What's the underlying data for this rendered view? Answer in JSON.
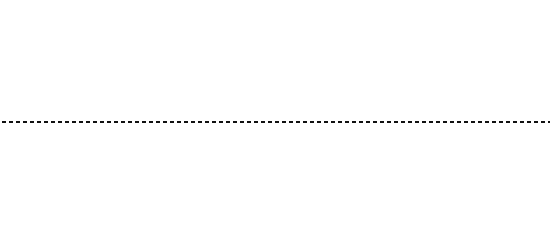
{
  "figure": {
    "background_color": "#ffffff",
    "digit_color": "#2b2b2b",
    "curve_color": "#3fc23f",
    "axis_color": "#111111",
    "annotation_color": "#202020",
    "panel_count": 2
  },
  "separator": {
    "name": "dashed-axis",
    "style": "dashed",
    "tick_count": 9,
    "tick_positions_px": [
      18,
      85,
      152,
      219,
      286,
      353,
      420,
      487,
      545
    ]
  },
  "panels": [
    {
      "id": "top",
      "vline_x_px": 73,
      "curve": {
        "color": "#3fc23f",
        "stroke_width": 1.9,
        "x_center_px": 118,
        "points": [
          [
            140,
            1
          ],
          [
            133,
            5
          ],
          [
            126,
            10
          ],
          [
            120,
            14
          ],
          [
            113,
            18
          ],
          [
            106,
            22
          ],
          [
            100,
            25
          ],
          [
            105,
            29
          ],
          [
            112,
            33
          ],
          [
            118,
            37
          ],
          [
            120,
            40
          ],
          [
            114,
            44
          ],
          [
            107,
            47
          ],
          [
            101,
            51
          ],
          [
            98,
            54
          ],
          [
            104,
            58
          ],
          [
            111,
            61
          ],
          [
            117,
            65
          ],
          [
            121,
            69
          ],
          [
            116,
            73
          ],
          [
            109,
            76
          ],
          [
            103,
            80
          ],
          [
            99,
            83
          ],
          [
            106,
            87
          ],
          [
            113,
            90
          ],
          [
            120,
            94
          ],
          [
            128,
            97
          ],
          [
            136,
            100
          ],
          [
            142,
            103
          ],
          [
            147,
            106
          ],
          [
            143,
            109
          ]
        ]
      },
      "rows": [
        "5 7 8 6 5 4 6 6 8 5 8 4 8 9 4 7 1 3 5 8 7 6 9 3 6 7 4 8 7 3 4 6 9 3 5 7 6 3 8 9 4 8 3 6 1 8 8 6 5 4 9 6 8 7 4 3 5 9 7 4 8 3 6 7 9 5 3 8 6 4 9 8 3 7 1 8 9 4 7 6 3 8 7 5 4 8 6 5 9 6 8 7 4",
        "6 5 4 7 8 6 3 9 8 2 9 8 4 4 7 6 8 8 2 3 7 8 5 4 6 9 5 4 8 3 7 2 6 4 8 9 3 5 7 6 4 8 2 9 5 7 6 3 8 4 7 9 5 2 6 8 3 4 7 5 9 6 2 8 4 7 3 5 9 6 8 2 4 7 8 3 6 5 9 4 7 2 8 6 3 5 9 7 4 6 8 3 5",
        "4 7 6 8 4 9 5 7 3 8 6 7 6 3 8 6 9 4 5 8 2 7 4 6 8 5 3 9 7 4 6 8 2 5 9 3 7 4 8 6 2 9 5 7 3 8 6 4 9 2 7 5 8 3 6 4 9 7 2 5 8 6 3 4 9 7 5 2 8 6 4 3 9 7 5 8 2 6 4 9 3 7 5 8 6 2 4 9 7 3 5 8 6",
        "8 3 4 7 6 9 4 5 3 8 7 5 8 4 8 5 7 3 7 6 3 8 8 6 7 4 5 9 3 8 2 6 7 4 9 5 3 8 6 7 2 4 9 5 8 3 6 7 4 2 9 8 5 3 7 6 4 9 2 8 5 7 3 6 4 9 8 2 5 7 3 6 9 4 8 5 2 7 6 3 9 4 8 5 7 2 6 3 9 8 4 5 7",
        "8 7 5 3 9 4 5 9 7 8 6 8 6 7 5 6 8 7 5 9 4 3 6 8 2 7 5 9 4 6 3 8 7 5 2 9 6 4 8 3 7 5 9 2 6 8 4 3 7 9 5 6 2 8 4 7 3 9 6 5 8 2 4 7 9 3 6 8 5 2 7 4 9 6 3 8 5 7 2 4 9 6 8 3 5 7 4 2 9 8 6 3 5",
        "7 4 8 9 5 4 7 8 6 3 5 4 5 8 7 5 3 7 6 9 3 2 4 8 6 7 5 9 3 4 8 2 6 7 9 5 3 8 4 6 2 7 9 5 8 3 4 6 7 2 9 8 5 4 3 7 6 9 2 8 5 4 7 3 6 9 8 2 5 4 7 6 3 9 8 5 2 4 6 7 3 9 5 8 4 2 6 7 9 3 5 8 4",
        "9 6 8 5 3 8 5 4 9 7 5 8 2 1 3 6 5 7 5 3 8 7 4 3 9 8 6 5 2 7 4 9 3 8 6 5 7 2 4 9 8 3 6 5 7 4 2 9 8 6 3 5 7 4 9 2 8 6 5 3 7 4 9 8 2 6 5 3 7 9 4 8 2 6 5 7 3 9 4 8 6 2 5 7 3 9 8 4 6 5 2 7 3",
        "5 4 9 6 2 8 4 4 5 8 7 9 8 4 4 6 7 3 9 8 4 7 6 5 3 2 9 8 4 6 7 5 3 8 9 2 4 6 7 5 3 9 8 4 2 6 7 5 9 3 8 4 6 2 7 5 9 8 3 4 6 2 7 9 5 8 3 4 6 7 2 9 5 8 4 3 6 7 9 2 5 8 4 6 3 7 9 5 2 8 6 4 3",
        "5 5 9 7 6 8 4 4 6 7 2 3 8 5 3 2 1 4 7 6 5 8 7 4 9 3 6 2 5 8 7 4 9 3 6 5 2 8 7 4 9 6 3 5 8 2 7 4 9 6 3 8 5 2 7 9 4 6 3 8 5 7 2 9 4 6 8 3 5 7 2 9 6 4 8 3 5 7 9 2 6 4 8 5 3 7 9 6 2 4 8 5 7",
        "6 8 3 6 6 9 5 6 7 1 8 3 5 6 8 4 4 5 1 8 7 6 4 9 3 5 2 8 6 7 4 9 3 5 8 2 6 7 4 9 5 3 8 6 2 7 4 9 5 8 3 6 7 2 4 9 5 8 6 3 7 2 4 9 8 5 6 3 7 4 2 9 8 5 6 7 3 4 9 2 5 8 6 7 4 3 9 5 2 8 6 7 4",
        "4 9 5 3 8 7 3 5 5 9 4 6 5 5 3 8 7 5 3 4 6 8 7 9 2 5 3 6 8 4 7 9 2 5 3 8 6 4 7 9 5 2 3 8 6 7 4 9 5 3 2 8 6 7 9 4 5 3 8 2 6 7 4 9 3 5 8 6 2 7 4 9 5 3 8 6 7 2 4 9 3 5 6 8 7 4 2 9 3 5 6 8 7",
        "7 6 5 9 7 3 8 5 6 4 9 3 7 8 5 4 3 8 6 4 7 5 9 2 3 6 8 5 4 7 9 2 6 3 8 5 4 7 9 6 2 3 8 5 7 4 9 6 3 2 8 5 7 9 4 6 3 8 2 5 7 4 9 6 8 3 2 5 7 4 9 8 6 3 5 2 7 4 9 8 6 5 3 2 7 9 4 8 6 5 3 2 7",
        "8 5 7 3 3 8 8 5 8 3 6 8 8 3 9 4 5 6 8 7 3 9 4 5 2 6 8 3 7 9 5 4 2 6 8 3 9 7 5 4 6 2 8 3 9 5 7 4 6 8 2 3 9 5 7 6 4 8 2 9 3 5 7 6 4 8 9 2 3 5 7 6 8 4 9 2 3 7 5 6 8 4 2 9 3 7 5 6 8 4 2 9 3",
        "8 4 6 7 6 4 8 7 6 4 8 6 9 6 6 5 7 3 9 4 8 6 5 3 7 9 2 4 6 8 5 3 7 9 4 2 6 8 5 7 3 9 4 6 2 8 5 7 9 3 4 6 8 2 5 7 9 4 3 6 8 5 2 7 9 4 6 3 8 5 7 2 9 4 6 8 3 5 7 9 2 4 6 8 3 5 9 7 4 2 6 8 5",
        "1 7 5 8 9 3 6 7 6 8 5 7 3 4 5 9 6 3 4 7 8 5 2 9 6 3 7 4 8 5 9 2 6 3 7 8 4 5 9 6 2 3 7 8 5 4 9 6 3 2 7 8 5 9 4 6 3 7 2 8 5 9 6 4 3 7 8 2 5 9 6 3 4 7 8 5 2 9 6 4 3 7 5 8 9 2 6 4 3 7 5 8 9",
        "5 6 8 7 5 3 8 6 4 9 6 8 5 6 7 4 2 9 3 8 5 6 7 4 9 2 3 8 5 6 7 9 4 2 3 8 6 5 7 9 4 3 2 8 6 5 9 7 4 3 8 2 6 5 9 7 4 8 3 2 6 5 9 4 7 8 3 6 2 5 9 4 7 3 8 6 2 5 9 7 4 3 8 6 5 2 9 7 4 3 6 8 5",
        "7 3 8 6 7 4 9 8 5 7 3 8 9 4 2 5 8 6 3 7 9 4 2 5 8 6 3 9 7 4 5 2 8 6 9 3 7 4 5 8 2 6 9 3 7 5 4 8 6 2 9 3 7 5 8 4 6 9 2 3 7 5 8 6 4 9 3 2 7 5 8 6 9 4 3 7 2 5 8 6 9 4 7 3 5 2 8 6 9 4 7 3 5"
      ]
    },
    {
      "id": "bottom",
      "vline_x_px": 107,
      "curve": {
        "color": "#3fc23f",
        "stroke_width": 1.9,
        "x_center_px": 120,
        "points": [
          [
            132,
            1
          ],
          [
            128,
            4
          ],
          [
            133,
            8
          ],
          [
            130,
            12
          ],
          [
            126,
            15
          ],
          [
            131,
            19
          ],
          [
            134,
            22
          ],
          [
            138,
            26
          ],
          [
            134,
            29
          ],
          [
            129,
            33
          ],
          [
            133,
            36
          ],
          [
            137,
            40
          ],
          [
            141,
            43
          ],
          [
            136,
            47
          ],
          [
            130,
            50
          ],
          [
            124,
            54
          ],
          [
            132,
            57
          ],
          [
            138,
            61
          ],
          [
            131,
            64
          ],
          [
            124,
            68
          ],
          [
            118,
            71
          ],
          [
            112,
            75
          ],
          [
            106,
            78
          ],
          [
            113,
            82
          ],
          [
            120,
            85
          ],
          [
            126,
            89
          ],
          [
            119,
            92
          ],
          [
            112,
            96
          ],
          [
            108,
            99
          ],
          [
            114,
            103
          ],
          [
            121,
            107
          ],
          [
            128,
            110
          ]
        ]
      },
      "annotations": [
        {
          "name": "highlight-circle-1",
          "cx": 56,
          "cy": 136,
          "rx": 6,
          "ry": 5
        },
        {
          "name": "highlight-circle-2",
          "cx": 19,
          "cy": 187,
          "rx": 7,
          "ry": 5
        }
      ],
      "rows": [
        "3 5 7 8 3 9 4 6 7 4 3 9 6 4 8 2 7 8 5 3 9 6 7 3 8 5 5 7 8 4 6 7 9 5 4 8 7 6 8 3 6 4 9 3 7 5 4 8 6 2 9 7 5 3 8 6 4 9 7 2 5 8 3 6 4 9 7 5 2 8 6 3 9 4 7 5 8 2 6 3 9 4 7 5 8 6 2 3 9 7 4 5 8",
        "7 8 3 6 7 4 4 6 5 7 3 8 9 4 5 8 3 5 5 7 4 3 8 6 7 9 5 3 4 7 8 6 9 4 4 6 5 8 7 3 6 4 9 8 3 5 7 2 6 9 4 8 3 7 5 6 2 9 8 4 7 3 5 6 9 2 8 4 7 5 3 6 9 8 2 4 7 5 3 9 6 8 4 2 7 5 9 3 6 8 4 7 2",
        "8 4 5 3 6 8 4 6 8 1 5 7 4 3 9 6 6 7 6 3 3 8 1 8 5 7 6 4 7 4 5 8 6 9 3 7 4 8 5 6 2 9 3 7 4 8 6 5 2 9 7 3 8 4 6 5 9 2 7 3 8 6 4 9 5 2 7 8 3 6 9 4 5 7 2 8 3 6 9 4 7 5 2 8 6 3 9 7 4 5 8 2 6",
        "5 3 7 8 5 2 3 8 6 4 3 9 6 7 6 8 9 5 4 8 7 3 5 9 7 4 6 7 8 5 6 7 8 9 3 4 7 8 4 6 5 7 9 4 3 8 6 2 5 9 7 4 3 8 6 5 9 2 7 4 8 3 6 5 9 7 2 4 8 6 3 5 9 7 4 2 8 6 5 3 9 7 4 6 8 2 5 3 9 7 6 4 8",
        "8 6 5 3 8 7 2 6 9 5 4 4 8 3 7 6 8 5 7 1 6 2 5 4 4 7 3 6 3 4 9 8 1 4 9 5 7 6 8 4 5 8 6 9 4 6 7 8 5 7 3 9 4 6 8 2 5 7 9 3 4 6 8 5 7 2 9 4 6 3 8 5 7 9 2 4 6 8 3 5 7 9 4 2 6 8 5 3 7 9 4 6 2",
        "9 4 5 8 3 4 9 6 7 8 8 5 3 6 7 8 8 4 5 4 9 8 5 7 6 4 9 3 8 5 7 2 6 4 9 8 3 5 7 6 4 2 9 8 5 3 7 6 4 9 2 8 5 7 3 6 9 4 8 2 5 7 6 3 9 4 8 5 2 7 6 9 3 4 8 5 7 2 6 9 4 3 8 5 7 6 2 9 4 3 8 5 7",
        "6 7 5 3 8 7 7 4 5 8 7 6 6 8 5 4 7 8 5 6 3 8 7 5 4 9 6 2 8 3 7 5 4 9 6 8 2 3 7 5 4 9 8 6 2 3 7 5 9 4 8 6 2 7 3 5 9 4 8 6 7 2 3 5 9 4 8 7 6 2 3 5 9 8 4 7 6 2 5 3 9 8 4 7 6 5 2 3 9 8 4 7 6",
        "7 3 5 6 8 7 9 5 8 3 5 5 5 4 8 6 5 4 6 8 3 5 7 9 4 6 2 8 3 5 7 9 6 4 2 8 3 5 9 7 6 4 8 2 3 5 9 7 4 6 8 2 5 3 9 7 4 8 6 5 2 3 9 7 4 8 6 2 5 9 3 7 4 8 6 5 2 9 3 7 8 4 6 5 2 9 7 3 8 4 6 5 2",
        "3 6 5 8 9 3 5 4 7 8 5 5 7 3 3 7 1 6 8 4 5 3 7 9 2 6 8 4 5 3 7 9 6 2 8 4 5 7 3 9 6 8 2 4 5 7 3 9 8 6 2 4 7 5 3 9 8 6 4 2 7 5 9 3 8 6 4 7 2 5 9 3 8 4 6 7 2 5 9 8 3 4 6 7 5 2 9 8 3 4 6 7 5",
        "2 6 8 3 6 5 9 6 8 4 6 6 7 5 8 9 3 4 5 4 7 8 6 3 5 9 2 4 7 8 6 3 5 9 4 2 7 8 6 5 3 9 4 7 2 8 6 5 9 3 4 7 8 2 6 5 9 4 3 7 8 6 2 5 9 4 7 3 8 6 5 2 9 4 7 8 3 6 5 9 2 4 7 8 6 3 5 9 4 2 7 8 6",
        "8 9 4 2 3 7 9 8 4 6 5 3 7 8 4 6 3 9 5 7 4 2 8 6 3 5 9 7 4 8 2 6 3 5 9 7 8 4 6 2 3 5 9 7 8 6 4 2 3 9 5 7 8 6 4 3 2 9 5 7 8 6 4 9 3 2 5 7 8 6 4 9 3 5 2 7 8 6 4 9 5 3 2 7 8 6 9 4 5 3 7 2 8",
        "9 5 7 6 8 5 6 9 7 9 5 3 6 5 8 9 6 7 8 9 5 4 3 6 8 7 2 9 5 4 6 3 8 7 9 5 2 4 6 8 3 7 9 5 6 4 2 8 7 3 9 5 6 8 4 2 7 9 3 5 6 8 4 7 2 9 5 3 6 8 7 4 2 9 5 6 3 8 7 4 9 2 5 6 8 3 7 4 9 5 2 6 8",
        "8 5 7 4 2 3 8 6 9 8 3 6 4 7 8 6 5 2 3 7 8 6 4 2 9 5 3 7 6 8 4 2 9 5 7 3 6 8 4 9 2 5 7 3 6 8 9 4 2 5 7 6 3 8 9 4 5 2 7 6 8 3 9 4 5 7 2 6 8 3 9 5 4 7 6 2 8 3 9 5 7 4 6 8 2 3 9 5 7 4 6 8 3",
        "6 5 8 7 9 6 3 6 8 3 7 4 8 5 9 6 2 4 7 3 8 5 6 9 4 2 7 3 8 6 5 9 4 7 2 3 8 6 5 9 7 4 2 3 8 6 9 5 7 4 2 8 3 6 9 5 7 4 8 2 3 6 9 5 7 8 4 2 6 3 9 5 8 7 4 6 2 3 9 5 8 7 6 4 2 9 3 5 8 7 6 4 2",
        "3 8 6 7 5 8 3 3 9 4 7 6 8 7 5 4 9 3 6 2 8 5 7 4 9 6 3 2 8 5 7 9 4 6 3 8 2 5 7 9 6 4 3 8 5 2 7 9 6 4 8 3 5 7 2 9 6 4 8 5 3 7 9 2 6 4 8 5 7 3 9 6 2 4 8 5 7 9 3 6 4 2 8 5 7 9 6 3 4 8 5 7 2",
        "5 8 9 5 6 3 8 8 5 5 3 3 7 9 6 7 6 4 9 3 8 5 7 2 6 4 9 3 8 5 7 6 2 4 9 3 8 7 5 6 2 9 4 3 8 7 5 6 9 2 4 3 8 7 6 5 9 2 4 8 3 7 6 5 9 4 2 8 3 7 6 9 5 4 2 8 3 7 9 6 5 4 2 8 7 3 9 6 5 4 8 2 7",
        "8 3 7 5 6 4 9 8 3 5 7 6 4 9 2 8 3 5 7 6 9 4 2 8 5 3 7 9 6 4 8 2 5 3 9 7 6 4 8 5 2 3 9 7 6 8 4 5 2 9 3 7 6 8 5 4 2 9 3 7 8 6 5 4 9 2 3 7 8 6 5 9 4 2 3 8 7 6 5 9 4 3 2 8 7 6 9 5 4 3 8 7 2"
      ]
    }
  ]
}
